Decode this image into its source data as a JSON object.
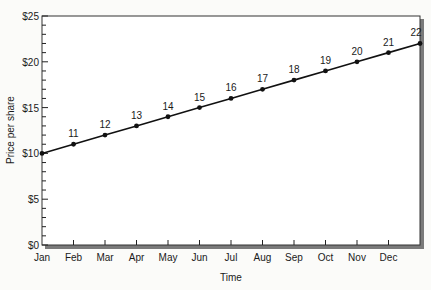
{
  "chart_data": {
    "type": "line",
    "title": "",
    "xlabel": "Time",
    "ylabel": "Price per share",
    "ylim": [
      0,
      25
    ],
    "y_ticks": [
      0,
      5,
      10,
      15,
      20,
      25
    ],
    "y_tick_labels": [
      "$0",
      "$5",
      "$10",
      "$15",
      "$20",
      "$25"
    ],
    "y_minor_step": 1,
    "categories": [
      "Jan",
      "Feb",
      "Mar",
      "Apr",
      "May",
      "Jun",
      "Jul",
      "Aug",
      "Sep",
      "Oct",
      "Nov",
      "Dec",
      ""
    ],
    "values": [
      10,
      11,
      12,
      13,
      14,
      15,
      16,
      17,
      18,
      19,
      20,
      21,
      22
    ],
    "point_labels": [
      "",
      "11",
      "12",
      "13",
      "14",
      "15",
      "16",
      "17",
      "18",
      "19",
      "20",
      "21",
      "22"
    ],
    "series": [
      {
        "name": "Price per share",
        "values": [
          10,
          11,
          12,
          13,
          14,
          15,
          16,
          17,
          18,
          19,
          20,
          21,
          22
        ]
      }
    ],
    "grid": false,
    "legend": null,
    "colors": {
      "line": "#111111",
      "frame": "#333333",
      "shadow": "#7a7a7a"
    }
  }
}
